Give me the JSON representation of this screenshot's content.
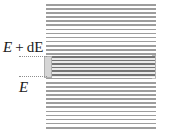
{
  "figure": {
    "labels": {
      "upper": "E + dE",
      "upper_symbol": "E",
      "upper_operator": "+",
      "upper_differential": "dE",
      "lower": "E"
    },
    "colors": {
      "stripe": "#9d9d9d",
      "stripe_background": "#ffffff",
      "band_stripe": "#747474",
      "band_background": "#ebebeb",
      "box_fill": "#d6d6d6",
      "box_border": "#b0b0b0",
      "leader_line": "#8e8e8e",
      "text": "#1a1a1a",
      "page_background": "#ffffff"
    },
    "elements": {
      "striped_block_name": "energy-continuum",
      "highlight_band_name": "energy-interval-band",
      "left_box_name": "interval-thickness-box",
      "right_bracket_name": "interval-bracket"
    }
  }
}
